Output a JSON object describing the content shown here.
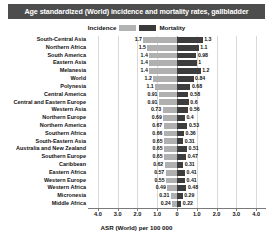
{
  "title": "Age standardized (World) incidence and mortality rates, gallbladder",
  "legend": {
    "incidence_label": "Incidence",
    "mortality_label": "Mortality",
    "incidence_color": "#b0b0b0",
    "mortality_color": "#3d3d3d",
    "position": "top-center"
  },
  "axis": {
    "title": "ASR (World) per 100 000",
    "tick_labels": [
      "4.0",
      "3.0",
      "2.0",
      "1.0",
      "0",
      "1.0",
      "2.0",
      "3.0",
      "4.0"
    ]
  },
  "chart_data": {
    "type": "bar",
    "orientation": "horizontal-diverging",
    "title": "Age standardized (World) incidence and mortality rates, gallbladder",
    "xlabel": "ASR (World) per 100 000",
    "ylabel": "",
    "xlim": [
      -4.5,
      4.5
    ],
    "grid": true,
    "legend_position": "top-center",
    "categories": [
      "South-Central Asia",
      "Northern Africa",
      "South America",
      "Eastern Asia",
      "Melanesia",
      "World",
      "Polynesia",
      "Central America",
      "Central and Eastern Europe",
      "Western Asia",
      "Northern Europe",
      "Northern America",
      "Southern Africa",
      "South-Eastern Asia",
      "Australia and New Zealand",
      "Southern Europe",
      "Caribbean",
      "Eastern Africa",
      "Western Europe",
      "Western Africa",
      "Micronesia",
      "Middle Africa"
    ],
    "series": [
      {
        "name": "Incidence",
        "color": "#b0b0b0",
        "direction": "left",
        "values": [
          1.7,
          1.5,
          1.4,
          1.4,
          1.4,
          1.2,
          1.1,
          0.91,
          0.91,
          0.73,
          0.69,
          0.67,
          0.66,
          0.65,
          0.65,
          0.65,
          0.62,
          0.57,
          0.55,
          0.49,
          0.31,
          0.24
        ]
      },
      {
        "name": "Mortality",
        "color": "#3d3d3d",
        "direction": "right",
        "values": [
          1.3,
          1.1,
          0.98,
          1.0,
          1.2,
          0.84,
          0.68,
          0.58,
          0.6,
          0.56,
          0.4,
          0.53,
          0.36,
          0.31,
          0.51,
          0.47,
          0.31,
          0.41,
          0.41,
          0.48,
          0.29,
          0.22
        ]
      }
    ]
  }
}
